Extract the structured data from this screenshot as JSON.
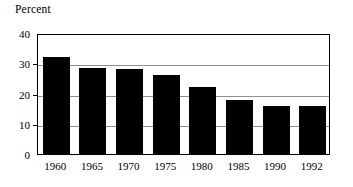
{
  "chart_data": {
    "type": "bar",
    "title": "Percent",
    "xlabel": "",
    "ylabel": "",
    "categories": [
      "1960",
      "1965",
      "1970",
      "1975",
      "1980",
      "1985",
      "1990",
      "1992"
    ],
    "values": [
      32,
      28.5,
      28,
      26,
      22,
      18,
      16,
      16
    ],
    "ylim": [
      0,
      40
    ],
    "yticks": [
      0,
      10,
      20,
      30,
      40
    ],
    "ytick_labels": [
      "0",
      "10",
      "20",
      "30",
      "40"
    ],
    "gridlines": [
      10,
      20,
      30
    ],
    "grid": true,
    "legend": "none",
    "bar_color": "#000000",
    "grid_color": "#8f8f8f",
    "frame_color": "#000000",
    "background": "#ffffff"
  }
}
